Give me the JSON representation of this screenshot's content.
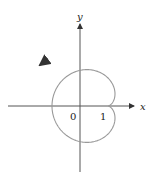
{
  "chart_data": {
    "type": "line",
    "subtype": "polar-curve",
    "title": "",
    "equation_hint": "cardioid r = 1 - cos(theta)",
    "xlabel": "x",
    "ylabel": "y",
    "tick_labels": {
      "origin": "0",
      "x_one": "1"
    },
    "key_points": [
      {
        "x": 0,
        "y": 0,
        "note": "cusp"
      },
      {
        "x": -2,
        "y": 0,
        "note": "leftmost point"
      },
      {
        "x": 0,
        "y": 1,
        "note": "top intercept"
      },
      {
        "x": 0,
        "y": -1,
        "note": "bottom intercept"
      }
    ],
    "xlim": [
      -2.3,
      2.3
    ],
    "ylim": [
      -1.9,
      2.7
    ],
    "grid": false,
    "legend": null,
    "direction_arrow": "counterclockwise on upper-left arc",
    "colors": {
      "curve": "#9a9a9a",
      "axes": "#555555"
    }
  },
  "labels": {
    "x_axis": "x",
    "y_axis": "y",
    "origin": "0",
    "one": "1"
  }
}
